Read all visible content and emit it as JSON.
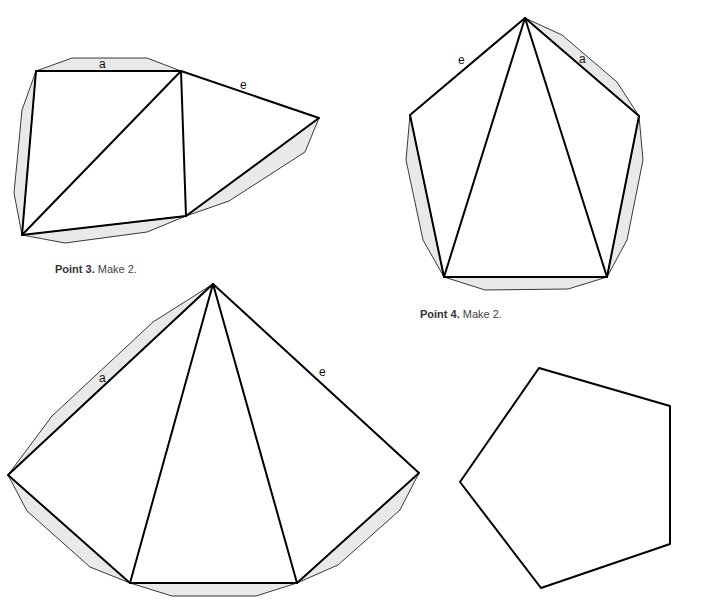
{
  "captions": {
    "point3": {
      "bold": "Point 3.",
      "text": " Make 2."
    },
    "point4": {
      "bold": "Point 4.",
      "text": " Make 2."
    }
  },
  "labels": {
    "shape1_a": "a",
    "shape1_e": "e",
    "shape2_e": "e",
    "shape2_a": "a",
    "shape3_a": "a",
    "shape3_e": "e"
  },
  "colors": {
    "tab_fill": "#e9e9e9",
    "line": "#000000"
  }
}
